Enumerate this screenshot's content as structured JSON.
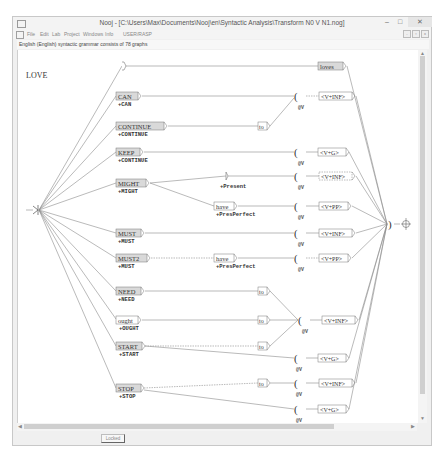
{
  "window": {
    "title": "Nooj - [C:\\Users\\Max\\Documents\\Nooj\\en\\Syntactic Analysis\\Transform N0 V N1.nog]",
    "controls": {
      "minimize": "–",
      "maximize": "□",
      "close": "✕"
    }
  },
  "menu": {
    "items": [
      "File",
      "Edit",
      "Lab",
      "Project",
      "Windows",
      "Info",
      "USER/RASP"
    ]
  },
  "document": {
    "header": "English (English) syntactic grammar consists of 78 graphs",
    "graph_title": "LOVE",
    "status": {
      "locked_label": "Locked"
    }
  },
  "graph": {
    "top_node": {
      "label": "loves"
    },
    "verbs": [
      {
        "label": "CAN",
        "output": "+CAN",
        "shaded": true
      },
      {
        "label": "CONTINUE",
        "output": "+CONTINUE",
        "shaded": true
      },
      {
        "label": "KEEP",
        "output": "+CONTINUE",
        "shaded": true
      },
      {
        "label": "MIGHT",
        "output": "+MIGHT",
        "shaded": true
      },
      {
        "label": "MUST",
        "output": "+MUST",
        "shaded": true
      },
      {
        "label": "MUST2",
        "output": "+MUST",
        "shaded": true
      },
      {
        "label": "NEED",
        "output": "+NEED",
        "shaded": true
      },
      {
        "label": "ought",
        "output": "+OUGHT",
        "shaded": false
      },
      {
        "label": "START",
        "output": "+START",
        "shaded": true
      },
      {
        "label": "STOP",
        "output": "+STOP",
        "shaded": true
      }
    ],
    "intermediate": {
      "to": "to",
      "have": "have",
      "present_output": "+Present",
      "presperfect_output": "+PresPerfect"
    },
    "paren_open": "(",
    "paren_close": ")",
    "var_label": "@V",
    "lexical_patterns": [
      "<V+INF>",
      "<V+G>",
      "<V+INF>",
      "<V+PP>",
      "<V+INF>",
      "<V+PP>",
      "<V+INF>",
      "<V+G>",
      "<V+INF>",
      "<V+G>"
    ],
    "final_node": "⊕"
  },
  "colors": {
    "node_fill": "#d9d9d9",
    "node_border": "#7a7a7a",
    "line": "#8c8c8c",
    "text": "#333333"
  }
}
